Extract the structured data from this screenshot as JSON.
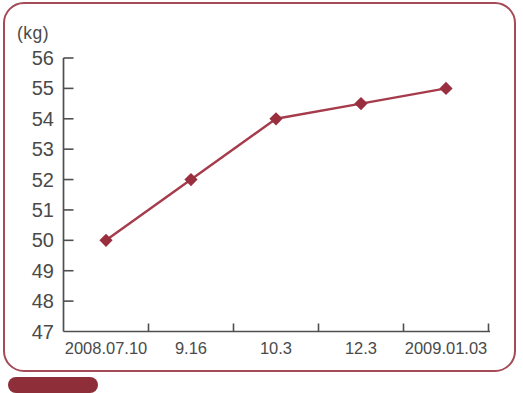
{
  "chart_data": {
    "type": "line",
    "title": "",
    "xlabel": "",
    "ylabel": "(kg)",
    "categories": [
      "2008.07.10",
      "9.16",
      "10.3",
      "12.3",
      "2009.01.03"
    ],
    "series": [
      {
        "name": "body-weight-kg",
        "values": [
          50,
          52,
          54,
          54.5,
          55
        ]
      }
    ],
    "ylim": [
      47,
      56
    ],
    "ytick_step": 1,
    "grid": false,
    "legend_position": "none",
    "marker_shape": "diamond",
    "axis_color": "#4f4f4f",
    "label_color": "#4a4a4a",
    "line_color": "#a63b4b",
    "marker_color": "#992e3e"
  },
  "frame": {
    "border_color": "#a54a57"
  },
  "badge": {
    "fill_color": "#8d2e38"
  }
}
